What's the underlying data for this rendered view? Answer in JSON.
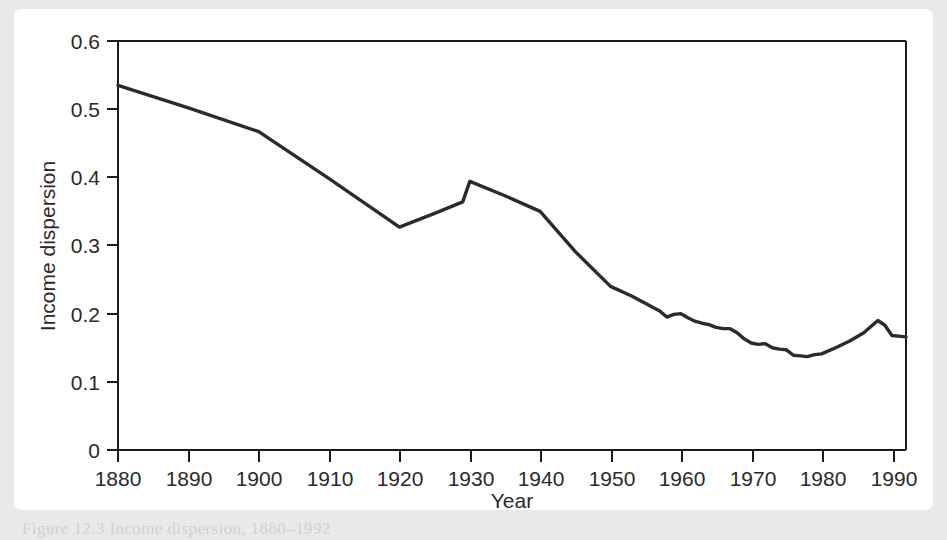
{
  "figure": {
    "caption_partial": "Figure 12.3   Income dispersion, 1880–1992",
    "background_color": "#e9e9e9",
    "card_color": "#ffffff",
    "line_color": "#2b2b2b",
    "axis_color": "#1a1a1a"
  },
  "chart_data": {
    "type": "line",
    "title": "",
    "xlabel": "Year",
    "ylabel": "Income dispersion",
    "xlim": [
      1880,
      1992
    ],
    "ylim": [
      0,
      0.6
    ],
    "grid": false,
    "legend": false,
    "xticks": [
      1880,
      1890,
      1900,
      1910,
      1920,
      1930,
      1940,
      1950,
      1960,
      1970,
      1980,
      1990
    ],
    "xtick_labels": [
      "1880",
      "1890",
      "1900",
      "1910",
      "1920",
      "1930",
      "1940",
      "1950",
      "1960",
      "1970",
      "1980",
      "1990"
    ],
    "yticks": [
      0,
      0.1,
      0.2,
      0.3,
      0.4,
      0.5,
      0.6
    ],
    "ytick_labels": [
      "0",
      "0.1",
      "0.2",
      "0.3",
      "0.4",
      "0.5",
      "0.6"
    ],
    "series": [
      {
        "name": "Income dispersion",
        "color": "#2b2b2b",
        "x": [
          1880,
          1890,
          1900,
          1910,
          1920,
          1925,
          1929,
          1930,
          1935,
          1940,
          1945,
          1950,
          1953,
          1955,
          1957,
          1958,
          1959,
          1960,
          1961,
          1962,
          1963,
          1964,
          1965,
          1966,
          1967,
          1968,
          1969,
          1970,
          1971,
          1972,
          1973,
          1974,
          1975,
          1976,
          1977,
          1978,
          1979,
          1980,
          1982,
          1984,
          1986,
          1988,
          1989,
          1990,
          1992
        ],
        "y": [
          0.535,
          0.502,
          0.467,
          0.398,
          0.327,
          0.347,
          0.364,
          0.394,
          0.373,
          0.35,
          0.291,
          0.24,
          0.226,
          0.215,
          0.204,
          0.195,
          0.199,
          0.2,
          0.194,
          0.189,
          0.186,
          0.184,
          0.18,
          0.178,
          0.178,
          0.172,
          0.163,
          0.157,
          0.155,
          0.156,
          0.15,
          0.148,
          0.147,
          0.139,
          0.138,
          0.137,
          0.14,
          0.141,
          0.15,
          0.16,
          0.172,
          0.19,
          0.183,
          0.168,
          0.166
        ]
      }
    ]
  }
}
